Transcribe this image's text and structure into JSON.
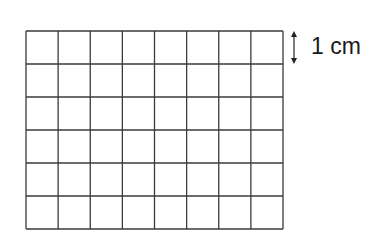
{
  "grid": {
    "columns": 8,
    "rows": 6,
    "x": 26,
    "y": 31,
    "width": 257,
    "height": 198,
    "line_color": "#3a3a3a"
  },
  "scale": {
    "label": "1 cm",
    "arrow": "double-headed vertical arrow spanning one cell height"
  }
}
